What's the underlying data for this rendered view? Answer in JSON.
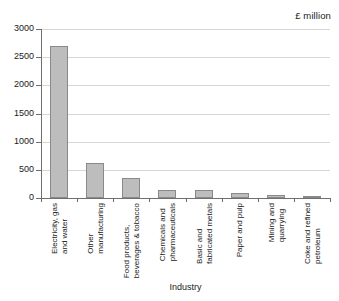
{
  "chart_data": {
    "type": "bar",
    "title": "",
    "units_label": "£ million",
    "xlabel": "Industry",
    "ylabel": "",
    "ylim": [
      0,
      3000
    ],
    "yticks": [
      0,
      500,
      1000,
      1500,
      2000,
      2500,
      3000
    ],
    "ytick_labels": [
      "0",
      "500",
      "1000",
      "1500",
      "2000",
      "2500",
      "3000"
    ],
    "grid": true,
    "legend": "none",
    "categories": [
      "Electricity, gas and water",
      "Other manufacturing",
      "Food products, beverages & tobacco",
      "Chemicals and pharmaceuticals",
      "Basic and fabricated metals",
      "Paper and pulp",
      "Mining and quarrying",
      "Coke and refined petroleum"
    ],
    "category_lines": [
      [
        "Electricity, gas",
        "and water"
      ],
      [
        "Other",
        "manufacturing"
      ],
      [
        "Food products,",
        "beverages & tobacco"
      ],
      [
        "Chemicals and",
        "pharmaceuticals"
      ],
      [
        "Basic and",
        "fabricated metals"
      ],
      [
        "Paper and pulp",
        ""
      ],
      [
        "Mining and",
        "quarrying"
      ],
      [
        "Coke and refined",
        "petroleum"
      ]
    ],
    "values": [
      2690,
      620,
      355,
      145,
      145,
      90,
      50,
      40
    ],
    "bar_color": "#bdbdbd",
    "bar_border_color": "#8a8a8a",
    "grid_color": "#d6d6d6",
    "axis_color": "#6f6f6f"
  }
}
